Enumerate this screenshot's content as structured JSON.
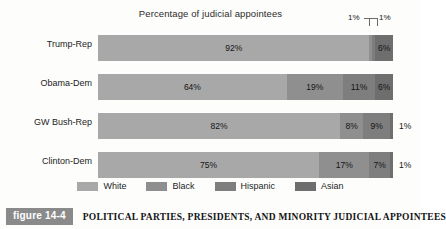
{
  "chart_data": {
    "type": "bar",
    "orientation": "horizontal",
    "stacked": true,
    "title": "Percentage of judicial appointees",
    "xlabel": "",
    "ylabel": "",
    "xlim": [
      0,
      100
    ],
    "grid": false,
    "legend_position": "bottom",
    "categories": [
      "Trump-Rep",
      "Obama-Dem",
      "GW Bush-Rep",
      "Clinton-Dem"
    ],
    "series": [
      {
        "name": "White",
        "color": "#a8a8a8",
        "values": [
          92,
          64,
          82,
          75
        ]
      },
      {
        "name": "Black",
        "color": "#8f8f8f",
        "values": [
          1,
          19,
          8,
          17
        ]
      },
      {
        "name": "Hispanic",
        "color": "#7e7e7e",
        "values": [
          1,
          11,
          9,
          7
        ]
      },
      {
        "name": "Asian",
        "color": "#6e6e6e",
        "values": [
          6,
          6,
          1,
          1
        ]
      }
    ],
    "rows": [
      {
        "category": "Trump-Rep",
        "segments": [
          {
            "series": "White",
            "value": 92,
            "label": "92%",
            "label_position": "inside"
          },
          {
            "series": "Black",
            "value": 1,
            "label": "1%",
            "label_position": "callout-left"
          },
          {
            "series": "Hispanic",
            "value": 1,
            "label": "1%",
            "label_position": "callout-right"
          },
          {
            "series": "Asian",
            "value": 6,
            "label": "6%",
            "label_position": "inside"
          }
        ],
        "outside_label": ""
      },
      {
        "category": "Obama-Dem",
        "segments": [
          {
            "series": "White",
            "value": 64,
            "label": "64%",
            "label_position": "inside"
          },
          {
            "series": "Black",
            "value": 19,
            "label": "19%",
            "label_position": "inside"
          },
          {
            "series": "Hispanic",
            "value": 11,
            "label": "11%",
            "label_position": "inside"
          },
          {
            "series": "Asian",
            "value": 6,
            "label": "6%",
            "label_position": "inside"
          }
        ],
        "outside_label": ""
      },
      {
        "category": "GW Bush-Rep",
        "segments": [
          {
            "series": "White",
            "value": 82,
            "label": "82%",
            "label_position": "inside"
          },
          {
            "series": "Black",
            "value": 8,
            "label": "8%",
            "label_position": "inside"
          },
          {
            "series": "Hispanic",
            "value": 9,
            "label": "9%",
            "label_position": "inside"
          },
          {
            "series": "Asian",
            "value": 1,
            "label": "",
            "label_position": "outside"
          }
        ],
        "outside_label": "1%"
      },
      {
        "category": "Clinton-Dem",
        "segments": [
          {
            "series": "White",
            "value": 75,
            "label": "75%",
            "label_position": "inside"
          },
          {
            "series": "Black",
            "value": 17,
            "label": "17%",
            "label_position": "inside"
          },
          {
            "series": "Hispanic",
            "value": 7,
            "label": "7%",
            "label_position": "inside"
          },
          {
            "series": "Asian",
            "value": 1,
            "label": "",
            "label_position": "outside"
          }
        ],
        "outside_label": "1%"
      }
    ],
    "callouts": [
      {
        "text": "1%",
        "points_to": "Trump-Rep Black segment"
      },
      {
        "text": "1%",
        "points_to": "Trump-Rep Hispanic segment"
      }
    ]
  },
  "legend": {
    "items": [
      {
        "label": "White",
        "color": "#a8a8a8"
      },
      {
        "label": "Black",
        "color": "#8f8f8f"
      },
      {
        "label": "Hispanic",
        "color": "#7e7e7e"
      },
      {
        "label": "Asian",
        "color": "#6e6e6e"
      }
    ]
  },
  "caption": {
    "figure_number": "figure 14-4",
    "text": "POLITICAL PARTIES, PRESIDENTS, AND MINORITY JUDICIAL APPOINTEES",
    "badge_color": "#8a8a8a"
  }
}
